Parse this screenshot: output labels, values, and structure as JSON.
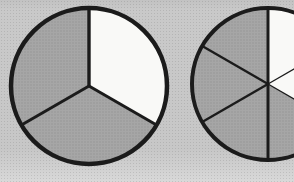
{
  "figure": {
    "colors": {
      "background": "#c7c7c7",
      "shaded_fill": "#a6a6a6",
      "shaded_dot": "#929292",
      "unshaded_fill": "#f9f9f7",
      "line": "#1b1b1b"
    }
  },
  "chart_data": [
    {
      "type": "pie",
      "name": "pie-thirds",
      "title": "",
      "num_slices": 3,
      "values": [
        1,
        1,
        1
      ],
      "shaded": [
        false,
        true,
        true
      ],
      "shaded_count": 2,
      "fraction_shaded": "2/3",
      "start_angle_deg": 0,
      "clockwise": true,
      "layout": {
        "cx": 89,
        "cy": 86,
        "r": 78,
        "outline_width": 4.5,
        "line_widths": [
          3.4,
          3,
          3
        ]
      }
    },
    {
      "type": "pie",
      "name": "pie-sixths",
      "title": "",
      "num_slices": 6,
      "values": [
        1,
        1,
        1,
        1,
        1,
        1
      ],
      "shaded": [
        false,
        false,
        true,
        true,
        true,
        true
      ],
      "shaded_count": 4,
      "fraction_shaded": "4/6",
      "start_angle_deg": 0,
      "clockwise": true,
      "layout": {
        "cx": 268,
        "cy": 84,
        "r": 76,
        "outline_width": 4,
        "line_widths": [
          3,
          1.3,
          1.3,
          3,
          2.4,
          2.4
        ]
      }
    }
  ]
}
